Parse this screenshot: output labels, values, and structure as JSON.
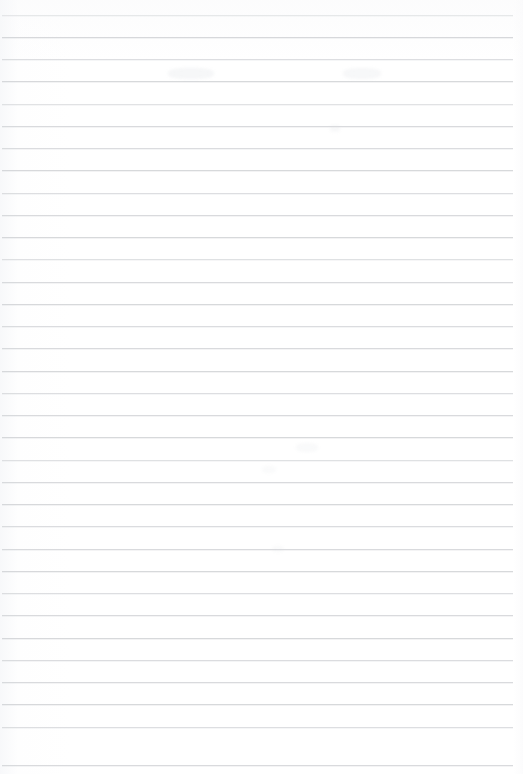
{
  "document": {
    "kind": "scanned-ruled-paper",
    "description": "Blank lined notebook page, scanned. No handwriting or printed text is present.",
    "page_width": 523,
    "page_height": 774,
    "background_color": "#ffffff",
    "has_text_content": false,
    "text_blocks": []
  },
  "ruling": {
    "line_color": "#d5d7da",
    "line_thickness_px": 1,
    "line_spacing_px": 22.3,
    "first_line_y": 15,
    "last_line_y": 765,
    "line_start_x": 2,
    "line_end_x": 513,
    "line_count": 34,
    "lines": [
      {
        "y": 15,
        "x1": 2,
        "x2": 513,
        "opacity": 0.55
      },
      {
        "y": 37,
        "x1": 2,
        "x2": 513,
        "opacity": 0.95
      },
      {
        "y": 59,
        "x1": 2,
        "x2": 513,
        "opacity": 0.8
      },
      {
        "y": 81,
        "x1": 2,
        "x2": 513,
        "opacity": 0.95
      },
      {
        "y": 104,
        "x1": 2,
        "x2": 513,
        "opacity": 0.7
      },
      {
        "y": 126,
        "x1": 2,
        "x2": 513,
        "opacity": 0.9
      },
      {
        "y": 148,
        "x1": 2,
        "x2": 513,
        "opacity": 0.85
      },
      {
        "y": 170,
        "x1": 2,
        "x2": 513,
        "opacity": 0.95
      },
      {
        "y": 193,
        "x1": 2,
        "x2": 513,
        "opacity": 0.8
      },
      {
        "y": 215,
        "x1": 2,
        "x2": 513,
        "opacity": 0.9
      },
      {
        "y": 237,
        "x1": 2,
        "x2": 513,
        "opacity": 0.95
      },
      {
        "y": 259,
        "x1": 2,
        "x2": 513,
        "opacity": 0.75
      },
      {
        "y": 282,
        "x1": 2,
        "x2": 513,
        "opacity": 0.9
      },
      {
        "y": 304,
        "x1": 2,
        "x2": 513,
        "opacity": 0.95
      },
      {
        "y": 326,
        "x1": 2,
        "x2": 513,
        "opacity": 0.85
      },
      {
        "y": 348,
        "x1": 2,
        "x2": 513,
        "opacity": 0.9
      },
      {
        "y": 371,
        "x1": 2,
        "x2": 513,
        "opacity": 0.95
      },
      {
        "y": 393,
        "x1": 2,
        "x2": 513,
        "opacity": 0.8
      },
      {
        "y": 415,
        "x1": 2,
        "x2": 513,
        "opacity": 0.9
      },
      {
        "y": 437,
        "x1": 2,
        "x2": 513,
        "opacity": 0.95
      },
      {
        "y": 460,
        "x1": 2,
        "x2": 513,
        "opacity": 0.75
      },
      {
        "y": 482,
        "x1": 2,
        "x2": 513,
        "opacity": 0.9
      },
      {
        "y": 504,
        "x1": 2,
        "x2": 513,
        "opacity": 0.95
      },
      {
        "y": 526,
        "x1": 2,
        "x2": 513,
        "opacity": 0.85
      },
      {
        "y": 549,
        "x1": 2,
        "x2": 513,
        "opacity": 0.9
      },
      {
        "y": 571,
        "x1": 2,
        "x2": 513,
        "opacity": 0.95
      },
      {
        "y": 593,
        "x1": 2,
        "x2": 513,
        "opacity": 0.8
      },
      {
        "y": 615,
        "x1": 2,
        "x2": 513,
        "opacity": 0.9
      },
      {
        "y": 638,
        "x1": 2,
        "x2": 513,
        "opacity": 0.95
      },
      {
        "y": 660,
        "x1": 2,
        "x2": 513,
        "opacity": 0.85
      },
      {
        "y": 682,
        "x1": 2,
        "x2": 513,
        "opacity": 0.9
      },
      {
        "y": 704,
        "x1": 2,
        "x2": 513,
        "opacity": 0.95
      },
      {
        "y": 727,
        "x1": 2,
        "x2": 513,
        "opacity": 0.8
      },
      {
        "y": 765,
        "x1": 2,
        "x2": 513,
        "opacity": 0.9
      }
    ]
  },
  "artifacts": {
    "note": "Faint illegible scanner ghosting / bleed-through. No readable characters.",
    "marks": [
      {
        "x": 168,
        "y": 68,
        "width": 46,
        "height": 11,
        "opacity": 0.4
      },
      {
        "x": 343,
        "y": 68,
        "width": 38,
        "height": 11,
        "opacity": 0.35
      },
      {
        "x": 330,
        "y": 125,
        "width": 10,
        "height": 7,
        "opacity": 0.3
      },
      {
        "x": 296,
        "y": 443,
        "width": 22,
        "height": 9,
        "opacity": 0.25
      },
      {
        "x": 262,
        "y": 466,
        "width": 14,
        "height": 7,
        "opacity": 0.22
      },
      {
        "x": 272,
        "y": 546,
        "width": 12,
        "height": 6,
        "opacity": 0.22
      }
    ]
  }
}
